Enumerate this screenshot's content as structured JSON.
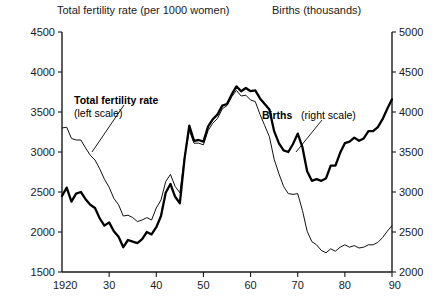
{
  "header": {
    "left_axis_title": "Total fertility rate (per 1000 women)",
    "right_axis_title": "Births (thousands)"
  },
  "annotations": {
    "fertility_bold": "Total fertility rate",
    "fertility_regular": "(left scale)",
    "births_bold": "Births",
    "births_regular": "(right scale)"
  },
  "chart_data": {
    "type": "line",
    "title": "",
    "xlabel": "",
    "ylabel": "Total fertility rate (per 1000 women)",
    "y2label": "Births (thousands)",
    "grid": false,
    "legend": "inline-annotations",
    "xlim": [
      1920,
      1990
    ],
    "ylim": [
      1500,
      4500
    ],
    "y2lim": [
      2000,
      5000
    ],
    "xticks": [
      1920,
      1930,
      1940,
      1950,
      1960,
      1970,
      1980,
      1990
    ],
    "xtick_labels": [
      "1920",
      "30",
      "40",
      "50",
      "60",
      "70",
      "80",
      "90"
    ],
    "yticks": [
      1500,
      2000,
      2500,
      3000,
      3500,
      4000,
      4500
    ],
    "ytick_labels": [
      "1500",
      "2000",
      "2500",
      "3000",
      "3500",
      "4000",
      "4500"
    ],
    "y2ticks": [
      2000,
      2500,
      3000,
      3500,
      4000,
      4500,
      5000
    ],
    "y2tick_labels": [
      "2000",
      "2500",
      "3000",
      "3500",
      "4000",
      "4500",
      "5000"
    ],
    "series": [
      {
        "name": "Total fertility rate",
        "scale": "left",
        "style": "thin",
        "x": [
          1920,
          1921,
          1922,
          1923,
          1924,
          1925,
          1926,
          1927,
          1928,
          1929,
          1930,
          1931,
          1932,
          1933,
          1934,
          1935,
          1936,
          1937,
          1938,
          1939,
          1940,
          1941,
          1942,
          1943,
          1944,
          1945,
          1946,
          1947,
          1948,
          1949,
          1950,
          1951,
          1952,
          1953,
          1954,
          1955,
          1956,
          1957,
          1958,
          1959,
          1960,
          1961,
          1962,
          1963,
          1964,
          1965,
          1966,
          1967,
          1968,
          1969,
          1970,
          1971,
          1972,
          1973,
          1974,
          1975,
          1976,
          1977,
          1978,
          1979,
          1980,
          1981,
          1982,
          1983,
          1984,
          1985,
          1986,
          1987,
          1988,
          1989,
          1990
        ],
        "y": [
          3300,
          3310,
          3170,
          3150,
          3150,
          3050,
          2960,
          2900,
          2790,
          2660,
          2560,
          2420,
          2340,
          2200,
          2210,
          2180,
          2130,
          2150,
          2180,
          2150,
          2300,
          2400,
          2630,
          2720,
          2570,
          2490,
          2940,
          3270,
          3110,
          3110,
          3090,
          3270,
          3360,
          3420,
          3540,
          3580,
          3690,
          3770,
          3700,
          3710,
          3650,
          3630,
          3470,
          3330,
          3190,
          2910,
          2730,
          2570,
          2480,
          2470,
          2480,
          2270,
          2010,
          1880,
          1840,
          1770,
          1740,
          1790,
          1760,
          1810,
          1840,
          1810,
          1830,
          1800,
          1810,
          1840,
          1840,
          1870,
          1930,
          2010,
          2080
        ]
      },
      {
        "name": "Births",
        "scale": "right",
        "style": "thick",
        "x": [
          1920,
          1921,
          1922,
          1923,
          1924,
          1925,
          1926,
          1927,
          1928,
          1929,
          1930,
          1931,
          1932,
          1933,
          1934,
          1935,
          1936,
          1937,
          1938,
          1939,
          1940,
          1941,
          1942,
          1943,
          1944,
          1945,
          1946,
          1947,
          1948,
          1949,
          1950,
          1951,
          1952,
          1953,
          1954,
          1955,
          1956,
          1957,
          1958,
          1959,
          1960,
          1961,
          1962,
          1963,
          1964,
          1965,
          1966,
          1967,
          1968,
          1969,
          1970,
          1971,
          1972,
          1973,
          1974,
          1975,
          1976,
          1977,
          1978,
          1979,
          1980,
          1981,
          1982,
          1983,
          1984,
          1985,
          1986,
          1987,
          1988,
          1989,
          1990
        ],
        "y": [
          2950,
          3055,
          2880,
          2980,
          3000,
          2910,
          2840,
          2800,
          2670,
          2580,
          2620,
          2510,
          2440,
          2310,
          2400,
          2380,
          2360,
          2410,
          2500,
          2470,
          2560,
          2700,
          2990,
          3100,
          2940,
          2860,
          3420,
          3830,
          3640,
          3650,
          3630,
          3820,
          3910,
          3970,
          4080,
          4100,
          4220,
          4320,
          4260,
          4300,
          4260,
          4270,
          4170,
          4100,
          4030,
          3760,
          3610,
          3520,
          3500,
          3600,
          3730,
          3560,
          3260,
          3140,
          3160,
          3140,
          3170,
          3330,
          3330,
          3490,
          3610,
          3630,
          3680,
          3640,
          3670,
          3760,
          3760,
          3810,
          3910,
          4040,
          4160
        ]
      }
    ]
  }
}
